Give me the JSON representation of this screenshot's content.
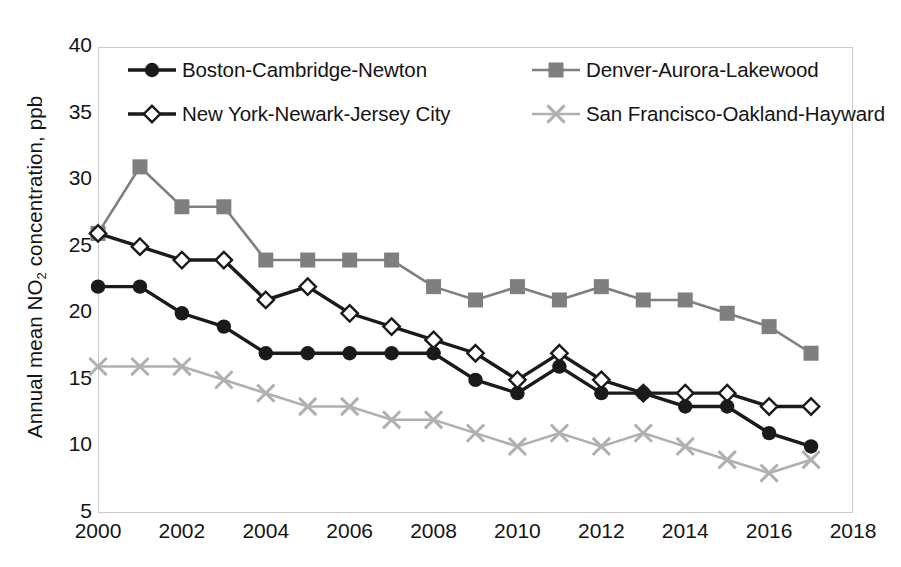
{
  "chart_data": {
    "type": "line",
    "title": "",
    "subtitle": "",
    "xlabel": "",
    "ylabel": "Annual mean NO2 concentration, ppb",
    "ylabel_prefix": "Annual mean NO",
    "ylabel_sub": "2",
    "ylabel_suffix": " concentration, ppb",
    "x": [
      2000,
      2001,
      2002,
      2003,
      2004,
      2005,
      2006,
      2007,
      2008,
      2009,
      2010,
      2011,
      2012,
      2013,
      2014,
      2015,
      2016,
      2017
    ],
    "xlim": [
      2000,
      2018
    ],
    "ylim": [
      5,
      40
    ],
    "xticks": [
      "2000",
      "2002",
      "2004",
      "2006",
      "2008",
      "2010",
      "2012",
      "2014",
      "2016",
      "2018"
    ],
    "xtick_values": [
      2000,
      2002,
      2004,
      2006,
      2008,
      2010,
      2012,
      2014,
      2016,
      2018
    ],
    "yticks": [
      "5",
      "10",
      "15",
      "20",
      "25",
      "30",
      "35",
      "40"
    ],
    "ytick_values": [
      5,
      10,
      15,
      20,
      25,
      30,
      35,
      40
    ],
    "grid": false,
    "legend_position": "top-inside",
    "series": [
      {
        "name": "Boston-Cambridge-Newton",
        "marker": "circle-filled",
        "color": "#1a1a1a",
        "values": [
          22,
          22,
          20,
          19,
          17,
          17,
          17,
          17,
          17,
          15,
          14,
          16,
          14,
          14,
          13,
          13,
          11,
          10
        ]
      },
      {
        "name": "Denver-Aurora-Lakewood",
        "marker": "square-filled",
        "color": "#7f7f7f",
        "values": [
          26,
          31,
          28,
          28,
          24,
          24,
          24,
          24,
          22,
          21,
          22,
          21,
          22,
          21,
          21,
          20,
          19,
          17
        ]
      },
      {
        "name": "New York-Newark-Jersey City",
        "marker": "diamond-open",
        "color": "#1a1a1a",
        "values": [
          26,
          25,
          24,
          24,
          21,
          22,
          20,
          19,
          18,
          17,
          15,
          17,
          15,
          14,
          14,
          14,
          13,
          13
        ]
      },
      {
        "name": "San Francisco-Oakland-Hayward",
        "marker": "cross",
        "color": "#b0b0b0",
        "values": [
          16,
          16,
          16,
          15,
          14,
          13,
          13,
          12,
          12,
          11,
          10,
          11,
          10,
          11,
          10,
          9,
          8,
          9
        ]
      }
    ]
  }
}
